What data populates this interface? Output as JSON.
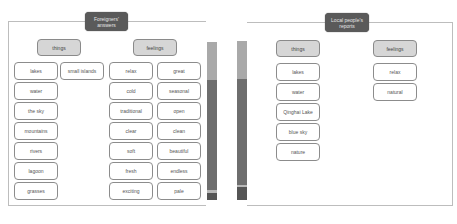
{
  "left_panel": {
    "title_line1": "Foreigners'",
    "title_line2": "answers",
    "things": {
      "label": "things",
      "col1": [
        "lakes",
        "water",
        "the sky",
        "mountains",
        "rivers",
        "lagoon",
        "grasses"
      ],
      "col2": [
        "small islands"
      ]
    },
    "feelings": {
      "label": "feelings",
      "col1": [
        "relax",
        "cold",
        "traditional",
        "clear",
        "soft",
        "fresh",
        "exciting"
      ],
      "col2": [
        "great",
        "seasonal",
        "open",
        "clean",
        "beautiful",
        "endless",
        "pale"
      ]
    }
  },
  "right_panel": {
    "title_line1": "Local people's",
    "title_line2": "reports",
    "things": {
      "label": "things",
      "col1": [
        "lakes",
        "water",
        "Qinghai Lake",
        "blue sky",
        "nature"
      ]
    },
    "feelings": {
      "label": "feelings",
      "col1": [
        "relax",
        "natural"
      ]
    }
  },
  "bars": {
    "left": {
      "segments": [
        {
          "color": "#a9a9a9",
          "height": 38
        },
        {
          "color": "#6e6e6e",
          "height": 110
        },
        {
          "color": "#b8b8b8",
          "height": 3
        },
        {
          "color": "#555555",
          "height": 7
        }
      ]
    },
    "right": {
      "segments": [
        {
          "color": "#a9a9a9",
          "height": 38
        },
        {
          "color": "#6e6e6e",
          "height": 106
        },
        {
          "color": "#b8b8b8",
          "height": 2
        },
        {
          "color": "#555555",
          "height": 13
        }
      ]
    }
  }
}
